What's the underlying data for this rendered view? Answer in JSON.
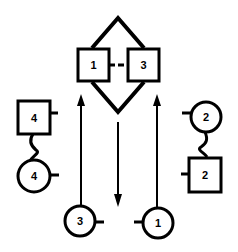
{
  "diagram": {
    "stroke_color": "#000000",
    "background": "#ffffff",
    "center_group": {
      "square_left_label": "1",
      "square_right_label": "3"
    },
    "left_pair": {
      "square_label": "4",
      "circle_label": "4"
    },
    "right_pair": {
      "circle_label": "2",
      "square_label": "2"
    },
    "bottom": {
      "circle_left_label": "3",
      "circle_right_label": "1"
    },
    "arrows": [
      {
        "id": "left-up",
        "direction": "up"
      },
      {
        "id": "center-down",
        "direction": "down"
      },
      {
        "id": "right-up",
        "direction": "up"
      }
    ]
  }
}
